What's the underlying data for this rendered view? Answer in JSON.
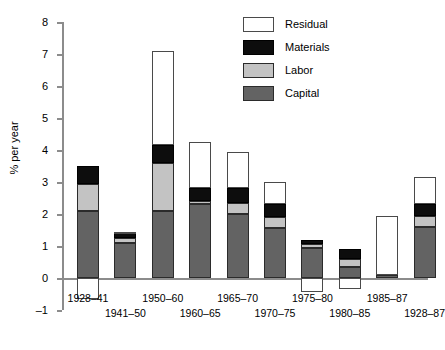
{
  "title_strip": "",
  "legend": {
    "position": "top-right",
    "items": [
      {
        "label": "Residual",
        "key": "residual",
        "color": "#ffffff"
      },
      {
        "label": "Materials",
        "key": "materials",
        "color": "#0d0d0d"
      },
      {
        "label": "Labor",
        "key": "labor",
        "color": "#c3c3c3"
      },
      {
        "label": "Capital",
        "key": "capital",
        "color": "#636363"
      }
    ]
  },
  "chart_data": {
    "type": "bar",
    "stacked": true,
    "title": "",
    "xlabel": "",
    "ylabel": "% per year",
    "ylim": [
      -1,
      8
    ],
    "yticks": [
      -1,
      0,
      1,
      2,
      3,
      4,
      5,
      6,
      7,
      8
    ],
    "ytick_labels": [
      "–1",
      "0",
      "1",
      "2",
      "3",
      "4",
      "5",
      "6",
      "7",
      "8"
    ],
    "grid": false,
    "categories": [
      "1928–41",
      "1941–50",
      "1950–60",
      "1960–65",
      "1965–70",
      "1970–75",
      "1975–80",
      "1980–85",
      "1985–87",
      "1928–87"
    ],
    "category_rows": [
      0,
      1,
      0,
      1,
      0,
      1,
      0,
      1,
      0,
      1
    ],
    "series": [
      {
        "name": "Capital",
        "color": "#636363",
        "values": [
          2.1,
          1.1,
          2.1,
          2.3,
          2.0,
          1.55,
          0.95,
          0.35,
          0.1,
          1.6
        ]
      },
      {
        "name": "Labor",
        "color": "#c3c3c3",
        "values": [
          0.85,
          0.15,
          1.5,
          0.1,
          0.35,
          0.35,
          0.1,
          0.25,
          0.0,
          0.35
        ]
      },
      {
        "name": "Materials",
        "color": "#0d0d0d",
        "values": [
          0.55,
          0.15,
          0.55,
          0.4,
          0.45,
          0.4,
          0.15,
          0.3,
          0.0,
          0.35
        ]
      },
      {
        "name": "Residual",
        "color": "#ffffff",
        "values": [
          -0.65,
          0.05,
          2.95,
          1.45,
          1.15,
          0.7,
          -0.45,
          -0.35,
          1.85,
          0.85
        ]
      }
    ],
    "totals": [
      3.5,
      1.45,
      7.1,
      4.25,
      3.95,
      3.0,
      1.2,
      0.9,
      1.95,
      3.15
    ],
    "negative_segments_note": "Residual is negative (drawn below zero) for 1928–41, 1975–80 and 1980–85"
  }
}
